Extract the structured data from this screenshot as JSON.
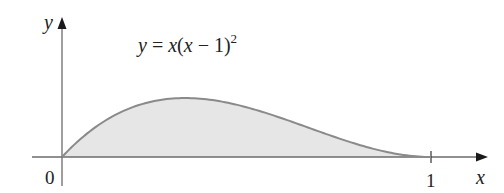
{
  "figure": {
    "function_label": {
      "lhs": "y",
      "eq": " = ",
      "x1": "x",
      "paren_open": "(",
      "x2": "x",
      "minus": " − ",
      "one": "1",
      "paren_close": ")",
      "exponent": "2"
    },
    "axes": {
      "x_label": "x",
      "y_label": "y",
      "origin_label": "0",
      "tick_label_1": "1"
    },
    "colors": {
      "axis": "#6b6b6b",
      "curve": "#8a8a8a",
      "fill": "#e6e6e6",
      "text": "#222222"
    }
  },
  "chart_data": {
    "type": "area",
    "function": "x*(x-1)^2",
    "x_range": [
      0,
      1
    ],
    "xlabel": "x",
    "ylabel": "y",
    "x_ticks": [
      0,
      1
    ],
    "x_tick_labels": [
      "0",
      "1"
    ],
    "shaded_region": "area between curve and x-axis for 0 ≤ x ≤ 1",
    "maximum": {
      "x": 0.3333,
      "y": 0.1481
    },
    "grid": false,
    "legend": "none"
  }
}
